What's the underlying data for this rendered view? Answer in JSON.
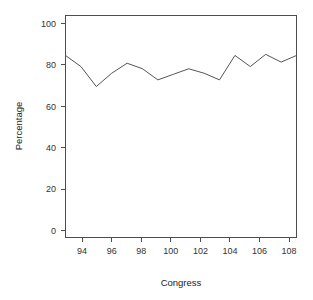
{
  "chart_data": {
    "type": "line",
    "title": "",
    "xlabel": "Congress",
    "ylabel": "Percentage",
    "x": [
      93,
      94,
      95,
      96,
      97,
      98,
      99,
      100,
      101,
      102,
      103,
      104,
      105,
      106,
      107,
      108
    ],
    "values": [
      82,
      77,
      68,
      74,
      78.5,
      76,
      71,
      73.5,
      76,
      74,
      71,
      82,
      77,
      82.5,
      79,
      82
    ],
    "series": [
      {
        "name": "Percentage",
        "values": [
          82,
          77,
          68,
          74,
          78.5,
          76,
          71,
          73.5,
          76,
          74,
          71,
          82,
          77,
          82.5,
          79,
          82
        ]
      }
    ],
    "xlim": [
      93,
      108
    ],
    "ylim": [
      0,
      100
    ],
    "xticks": [
      94,
      96,
      98,
      100,
      102,
      104,
      106,
      108
    ],
    "yticks": [
      0,
      20,
      40,
      60,
      80,
      100
    ],
    "xtick_labels": [
      "94",
      "96",
      "98",
      "100",
      "102",
      "104",
      "106",
      "108"
    ],
    "ytick_labels": [
      "0",
      "20",
      "40",
      "60",
      "80",
      "100"
    ],
    "grid": false,
    "legend": false,
    "legend_position": "none",
    "line_color": "#555555",
    "background_color": "#ffffff",
    "axis_color": "#4d4d4d"
  },
  "axes": {
    "y_axis_title": "Percentage",
    "x_axis_title": "Congress",
    "y_tick_labels": [
      "100",
      "80",
      "60",
      "40",
      "20",
      "0"
    ],
    "x_tick_labels": [
      "94",
      "96",
      "98",
      "100",
      "102",
      "104",
      "106",
      "108"
    ]
  }
}
